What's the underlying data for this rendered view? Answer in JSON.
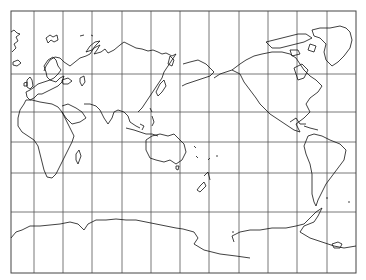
{
  "map": {
    "projection": "cylindrical",
    "center": "pacific",
    "frame": {
      "x": 11,
      "y": 11,
      "width": 345,
      "height": 262
    },
    "graticule": {
      "vertical_x": [
        34,
        63,
        92,
        122,
        151,
        180,
        209,
        239,
        268,
        297,
        327
      ],
      "horizontal_y": [
        74,
        112,
        142,
        173,
        212
      ]
    },
    "colors": {
      "background": "#ffffff",
      "grid": "#555555",
      "coast": "#111111"
    },
    "top_caption": ""
  }
}
